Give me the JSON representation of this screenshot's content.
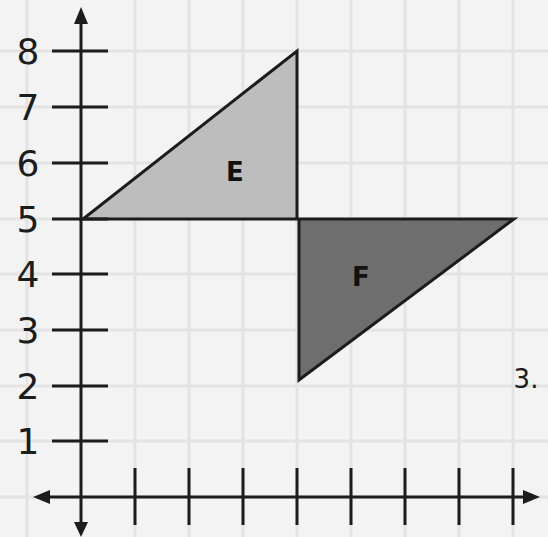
{
  "diagram": {
    "type": "coordinate-plane-reflection",
    "problem_number": "3.",
    "y_axis": {
      "ticks": [
        "1",
        "2",
        "3",
        "4",
        "5",
        "6",
        "7",
        "8"
      ]
    },
    "x_axis": {
      "tick_count": 8,
      "labels_shown": false
    },
    "shapes": [
      {
        "label": "E",
        "vertices": [
          [
            0,
            5
          ],
          [
            4,
            5
          ],
          [
            4,
            8
          ]
        ],
        "fill": "#bdbdbd"
      },
      {
        "label": "F",
        "vertices": [
          [
            4,
            5
          ],
          [
            8,
            5
          ],
          [
            4,
            2
          ]
        ],
        "fill": "#6e6e6e"
      }
    ],
    "colors": {
      "background": "#f3f3f3",
      "grid": "#e2e2e2",
      "axis": "#1c1c1c"
    }
  }
}
